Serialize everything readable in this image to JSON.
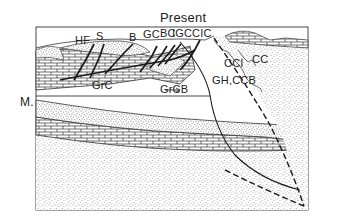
{
  "title": "Present",
  "side_label": "M.",
  "labels": {
    "hf": "HF",
    "s": "S",
    "b": "B",
    "gc": "GC",
    "bc": "BC",
    "igc": "IGC",
    "cic": "CIC",
    "cci": "CCI",
    "cc": "CC",
    "grc": "GrC",
    "grcb": "GrCB",
    "gh_ccb": "GH,CCB"
  },
  "legend_patterns": [
    "limestone-brick",
    "stippled-sandstone",
    "blank"
  ],
  "colors": {
    "ink": "#222222",
    "stipple": "#9a9a9a",
    "background": "#ffffff"
  }
}
